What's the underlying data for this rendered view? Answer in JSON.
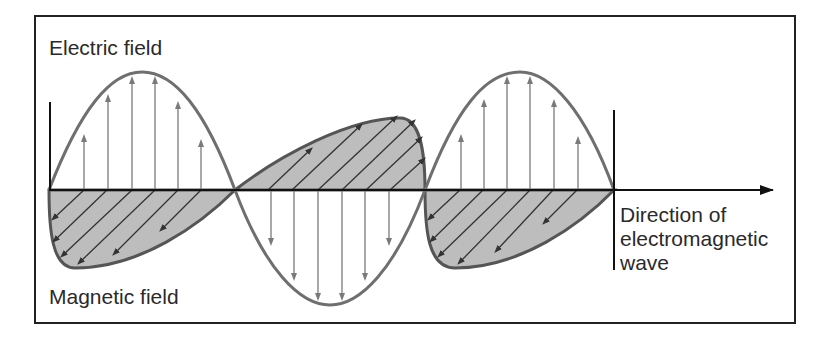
{
  "diagram": {
    "labels": {
      "electric_field": "Electric field",
      "magnetic_field": "Magnetic field",
      "direction_line1": "Direction of",
      "direction_line2": "electromagnetic",
      "direction_line3": "wave"
    },
    "colors": {
      "wave_line": "#6f6f6f",
      "axis": "#111111",
      "lobe_fill": "#bdbdbd",
      "arrow": "#7a7a7a",
      "hatch": "#3a3a3a"
    }
  }
}
